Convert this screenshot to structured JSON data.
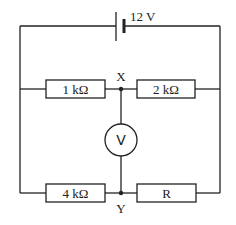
{
  "diagram": {
    "type": "circuit",
    "battery": {
      "label": "12 V"
    },
    "resistors": [
      {
        "id": "r1",
        "label": "1 kΩ",
        "position": "top-left"
      },
      {
        "id": "r2",
        "label": "2 kΩ",
        "position": "top-right"
      },
      {
        "id": "r3",
        "label": "4 kΩ",
        "position": "bottom-left"
      },
      {
        "id": "r4",
        "label": "R",
        "position": "bottom-right"
      }
    ],
    "voltmeter": {
      "label": "V"
    },
    "nodes": [
      {
        "id": "x",
        "label": "X"
      },
      {
        "id": "y",
        "label": "Y"
      }
    ]
  }
}
